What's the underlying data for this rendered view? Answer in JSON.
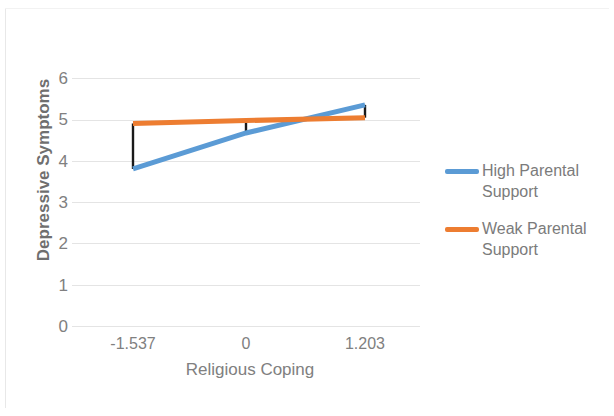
{
  "chart_data": {
    "type": "line",
    "title": "",
    "xlabel": "Religious Coping",
    "ylabel": "Depressive Symptoms",
    "x": [
      -1.537,
      0,
      1.203
    ],
    "xtick_labels": [
      "-1.537",
      "0",
      "1.203"
    ],
    "ytick_labels": [
      "0",
      "1",
      "2",
      "3",
      "4",
      "5",
      "6"
    ],
    "ylim": [
      0,
      6
    ],
    "yticks": [
      0,
      1,
      2,
      3,
      4,
      5,
      6
    ],
    "grid": true,
    "legend_position": "right",
    "series": [
      {
        "name": "High Parental Support",
        "color": "#5B9BD5",
        "values": [
          3.8,
          4.67,
          5.35
        ]
      },
      {
        "name": "Weak Parental Support",
        "color": "#ED7D31",
        "values": [
          4.9,
          4.97,
          5.04
        ]
      }
    ],
    "error_bars": {
      "color": "#1a1a1a",
      "segments": [
        {
          "x": -1.537,
          "low": 3.8,
          "high": 4.9
        },
        {
          "x": 0,
          "low": 4.67,
          "high": 4.97
        },
        {
          "x": 1.203,
          "low": 5.04,
          "high": 5.35
        }
      ]
    }
  },
  "axes": {
    "x_title": "Religious Coping",
    "y_title": "Depressive Symptoms",
    "x_ticks": [
      "-1.537",
      "0",
      "1.203"
    ],
    "y_ticks": [
      "6",
      "5",
      "4",
      "3",
      "2",
      "1",
      "0"
    ]
  },
  "legend": {
    "entries": [
      {
        "label": "High Parental Support",
        "color": "#5B9BD5"
      },
      {
        "label": "Weak Parental Support",
        "color": "#ED7D31"
      }
    ]
  },
  "colors": {
    "series_high": "#5B9BD5",
    "series_weak": "#ED7D31",
    "error_bar": "#1a1a1a",
    "gridline": "#e4e4e4",
    "text": "#808080"
  }
}
